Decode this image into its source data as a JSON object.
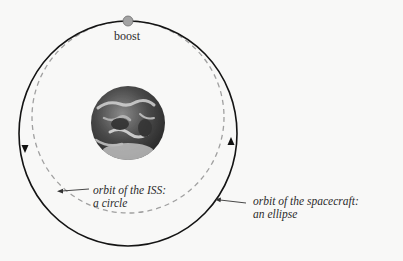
{
  "diagram": {
    "boost_label": "boost",
    "iss_orbit": {
      "label_line1": "orbit of the ISS:",
      "label_line2": "a circle",
      "style": "dashed",
      "color": "#9a9a9a"
    },
    "spacecraft_orbit": {
      "label_line1": "orbit of the spacecraft:",
      "label_line2": "an ellipse",
      "style": "solid",
      "color": "#111111"
    },
    "earth": {
      "name": "Earth"
    },
    "boost_point_color": "#9c9c9c"
  }
}
